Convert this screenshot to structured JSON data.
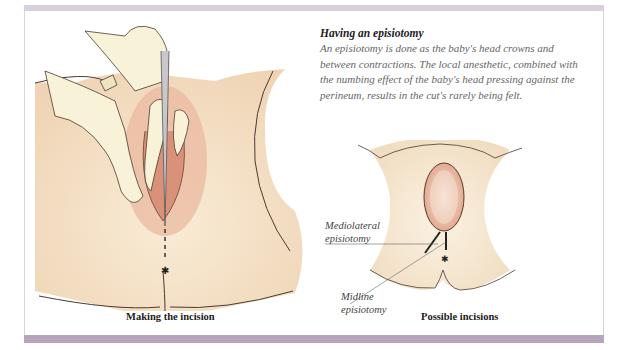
{
  "sidebar": {
    "title": "Having an episiotomy",
    "body": "An episiotomy is done as the baby's head crowns and between contractions. The local anesthetic, combined with the numbing effect of the baby's head pressing against the perineum, results in the cut's rarely being felt."
  },
  "figures": {
    "left": {
      "caption": "Making the incision"
    },
    "right": {
      "caption": "Possible incisions",
      "labels": {
        "mediolateral_line1": "Mediolateral",
        "mediolateral_line2": "episiotomy",
        "midline_line1": "Midline",
        "midline_line2": "episiotomy"
      }
    }
  },
  "colors": {
    "top_bar": "#d8d0dc",
    "bottom_bar": "#b9a4bd",
    "skin": "#f6e6cc",
    "skin_shadow": "#eccfb0",
    "tissue": "#e0a88a",
    "glove": "#f8f2d8",
    "outline": "#4a3a30"
  }
}
